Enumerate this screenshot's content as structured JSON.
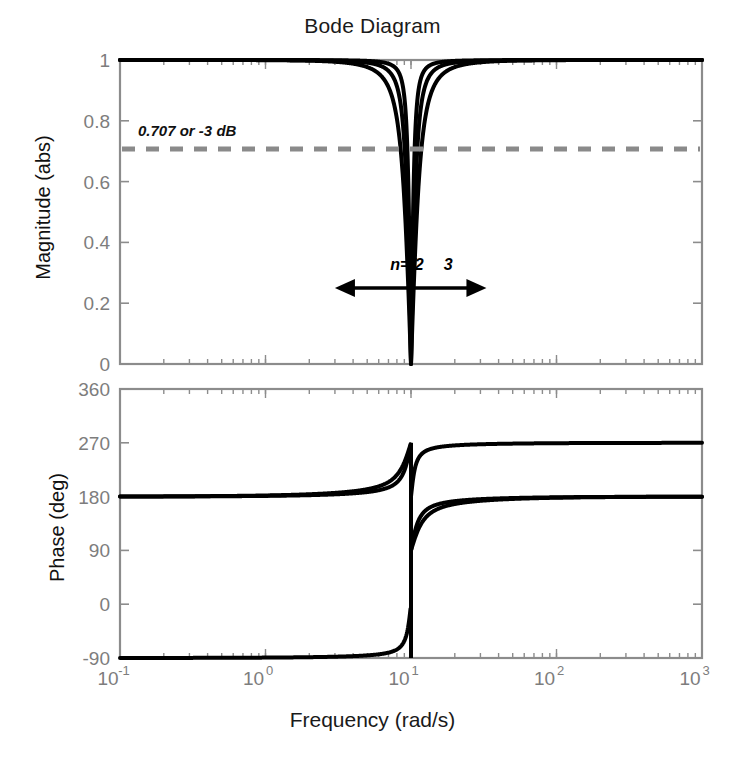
{
  "chart_data": {
    "type": "line",
    "title": "Bode Diagram",
    "xlabel": "Frequency  (rad/s)",
    "xscale": "log",
    "xlim": [
      0.1,
      1000
    ],
    "xticks": [
      0.1,
      1,
      10,
      100,
      1000
    ],
    "xticklabels": [
      "10-1",
      "100",
      "101",
      "102",
      "103"
    ],
    "xtick_bases": [
      "10",
      "10",
      "10",
      "10",
      "10"
    ],
    "xtick_exponents": [
      "-1",
      "0",
      "1",
      "2",
      "3"
    ],
    "grid": false,
    "legend": "inline-annotations",
    "subplots": [
      {
        "name": "magnitude",
        "ylabel": "Magnitude (abs)",
        "ylim": [
          0,
          1
        ],
        "yticks": [
          0,
          0.2,
          0.4,
          0.6,
          0.8,
          1
        ],
        "yticklabels": [
          "0",
          "0.2",
          "0.4",
          "0.6",
          "0.8",
          "1"
        ],
        "reference_line": {
          "value": 0.707,
          "label": "0.707 or -3 dB",
          "style": "dashed",
          "color": "#8a8a8a"
        },
        "annotations": [
          {
            "text": "n=1",
            "x": 9.0,
            "y": 0.31
          },
          {
            "text": "2",
            "x": 11.4,
            "y": 0.31
          },
          {
            "text": "3",
            "x": 18.0,
            "y": 0.31
          }
        ],
        "arrow": {
          "y": 0.25,
          "x_left": 3.0,
          "x_right": 33.0,
          "double_headed": true
        },
        "series": [
          {
            "name": "n=1",
            "notch_order": 1,
            "center_freq": 10,
            "color": "#000000"
          },
          {
            "name": "n=2",
            "notch_order": 2,
            "center_freq": 10,
            "color": "#000000"
          },
          {
            "name": "n=3",
            "notch_order": 3,
            "center_freq": 10,
            "color": "#000000"
          }
        ],
        "description": "Three notch-filter magnitude responses, all unity gain far from 10 rad/s, dropping to 0 at 10 rad/s; n=1 narrowest, n=3 widest."
      },
      {
        "name": "phase",
        "ylabel": "Phase (deg)",
        "ylim": [
          -90,
          360
        ],
        "yticks": [
          -90,
          0,
          90,
          180,
          270,
          360
        ],
        "yticklabels": [
          "-90",
          "0",
          "90",
          "180",
          "270",
          "360"
        ],
        "series": [
          {
            "name": "n=1",
            "start_deg": 0,
            "jump_freq": 10,
            "jump_from_deg": -90,
            "jump_to_deg": 270,
            "end_deg": 0,
            "color": "#000000"
          },
          {
            "name": "n=2",
            "start_deg": 360,
            "jump_freq": 10,
            "jump_from_deg": 90,
            "jump_to_deg": 90,
            "end_deg": 0,
            "color": "#000000"
          },
          {
            "name": "n=3",
            "start_deg": 360,
            "jump_freq": 10,
            "jump_from_deg": 170,
            "jump_to_deg": 170,
            "end_deg": 0,
            "color": "#000000"
          }
        ],
        "description": "Phase curves start at 360 deg (two curves) and 0 deg (one curve), with a vertical discontinuity at 10 rad/s from -90 to 270 deg, all converging to 0 deg at high frequency."
      }
    ]
  },
  "axes": {
    "magnitude": {
      "ylabel": "Magnitude (abs)",
      "ytick_0": "0",
      "ytick_02": "0.2",
      "ytick_04": "0.4",
      "ytick_06": "0.6",
      "ytick_08": "0.8",
      "ytick_1": "1"
    },
    "phase": {
      "ylabel": "Phase (deg)",
      "ytick_m90": "-90",
      "ytick_0": "0",
      "ytick_90": "90",
      "ytick_180": "180",
      "ytick_270": "270",
      "ytick_360": "360"
    },
    "x": {
      "title": "Frequency  (rad/s)",
      "base": "10",
      "exp_m1": "-1",
      "exp_0": "0",
      "exp_1": "1",
      "exp_2": "2",
      "exp_3": "3"
    }
  },
  "title": "Bode Diagram",
  "annotations": {
    "threshold": "0.707 or -3 dB",
    "n1": "n=1",
    "n2": "2",
    "n3": "3"
  },
  "colors": {
    "curve": "#000000",
    "axis": "#8c8c8c",
    "tick_text": "#7d7d7d",
    "dashed_ref": "#8a8a8a",
    "title_text": "#1a1a1a"
  }
}
